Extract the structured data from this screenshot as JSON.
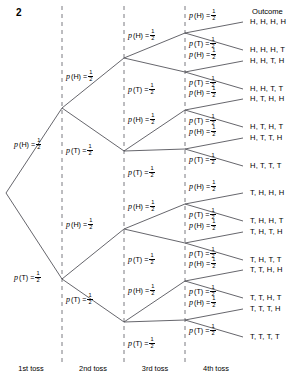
{
  "figure": {
    "number": "2",
    "type": "probability-tree-diagram"
  },
  "outcome_header": "Outcome",
  "columns": [
    {
      "label": "1st toss",
      "x": 31
    },
    {
      "label": "2nd toss",
      "x": 93
    },
    {
      "label": "3rd toss",
      "x": 155
    },
    {
      "label": "4th toss",
      "x": 216
    }
  ],
  "axis_dividers": [
    62,
    124,
    185
  ],
  "branch_labels": {
    "heads": {
      "p": "p",
      "event": "(H) =",
      "num": "1",
      "den": "2"
    },
    "tails": {
      "p": "p",
      "event": "(T) =",
      "num": "1",
      "den": "2"
    }
  },
  "outcomes": [
    {
      "label": "H, H, H, H",
      "y": 22
    },
    {
      "label": "H, H, H, T",
      "y": 50
    },
    {
      "label": "H, H, T, H",
      "y": 61
    },
    {
      "label": "H, H, T, T",
      "y": 89
    },
    {
      "label": "H, T, H, H",
      "y": 99
    },
    {
      "label": "H, T, H, T",
      "y": 127
    },
    {
      "label": "H, T, T, H",
      "y": 138
    },
    {
      "label": "H, T, T, T",
      "y": 166
    },
    {
      "label": "T, H, H, H",
      "y": 193
    },
    {
      "label": "T, H, H, T",
      "y": 221
    },
    {
      "label": "T, H, T, H",
      "y": 232
    },
    {
      "label": "T, H, T, T",
      "y": 260
    },
    {
      "label": "T, T, H, H",
      "y": 270
    },
    {
      "label": "T, T, H, T",
      "y": 298
    },
    {
      "label": "T, T, T, H",
      "y": 309
    },
    {
      "label": "T, T, T, T",
      "y": 337
    }
  ],
  "probability_labels": [
    {
      "branch": "heads",
      "x": 14,
      "y": 142
    },
    {
      "branch": "tails",
      "x": 14,
      "y": 275
    },
    {
      "branch": "heads",
      "x": 66,
      "y": 74
    },
    {
      "branch": "tails",
      "x": 66,
      "y": 148
    },
    {
      "branch": "heads",
      "x": 66,
      "y": 222
    },
    {
      "branch": "tails",
      "x": 66,
      "y": 297
    },
    {
      "branch": "heads",
      "x": 128,
      "y": 33
    },
    {
      "branch": "tails",
      "x": 128,
      "y": 87
    },
    {
      "branch": "heads",
      "x": 128,
      "y": 117
    },
    {
      "branch": "tails",
      "x": 128,
      "y": 170
    },
    {
      "branch": "heads",
      "x": 128,
      "y": 204
    },
    {
      "branch": "tails",
      "x": 128,
      "y": 257
    },
    {
      "branch": "heads",
      "x": 128,
      "y": 288
    },
    {
      "branch": "tails",
      "x": 128,
      "y": 341
    },
    {
      "branch": "heads",
      "x": 189,
      "y": 13
    },
    {
      "branch": "tails",
      "x": 189,
      "y": 41
    },
    {
      "branch": "heads",
      "x": 189,
      "y": 52
    },
    {
      "branch": "tails",
      "x": 189,
      "y": 80
    },
    {
      "branch": "heads",
      "x": 189,
      "y": 90
    },
    {
      "branch": "tails",
      "x": 189,
      "y": 118
    },
    {
      "branch": "heads",
      "x": 189,
      "y": 129
    },
    {
      "branch": "tails",
      "x": 189,
      "y": 157
    },
    {
      "branch": "heads",
      "x": 189,
      "y": 184
    },
    {
      "branch": "tails",
      "x": 189,
      "y": 212
    },
    {
      "branch": "heads",
      "x": 189,
      "y": 223
    },
    {
      "branch": "tails",
      "x": 189,
      "y": 251
    },
    {
      "branch": "heads",
      "x": 189,
      "y": 261
    },
    {
      "branch": "tails",
      "x": 189,
      "y": 289
    },
    {
      "branch": "heads",
      "x": 189,
      "y": 300
    },
    {
      "branch": "tails",
      "x": 189,
      "y": 328
    }
  ],
  "nodes": {
    "root": {
      "x": 6,
      "y": 193
    },
    "level2": [
      {
        "x": 62,
        "y": 108
      },
      {
        "x": 62,
        "y": 279
      }
    ],
    "level3": [
      {
        "x": 124,
        "y": 58
      },
      {
        "x": 124,
        "y": 151
      },
      {
        "x": 124,
        "y": 229
      },
      {
        "x": 124,
        "y": 322
      }
    ],
    "level4": [
      {
        "x": 185,
        "y": 33
      },
      {
        "x": 185,
        "y": 72
      },
      {
        "x": 185,
        "y": 110
      },
      {
        "x": 185,
        "y": 149
      },
      {
        "x": 185,
        "y": 204
      },
      {
        "x": 185,
        "y": 243
      },
      {
        "x": 185,
        "y": 281
      },
      {
        "x": 185,
        "y": 320
      }
    ],
    "leaf_x": 243
  },
  "colors": {
    "line": "#4a4a52",
    "divider": "#6b6b73",
    "text": "#1a1a1a"
  }
}
